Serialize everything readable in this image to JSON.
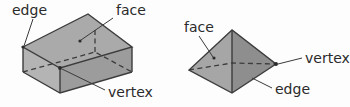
{
  "diagram": {
    "background_color": "#fdfdfd",
    "line_color": "#3c3c3c",
    "text_color": "#2b2b2b",
    "shapes": [
      {
        "id": "cuboid",
        "name": "cuboid",
        "labels": {
          "edge": "edge",
          "face": "face",
          "vertex": "vertex"
        },
        "face_colors": {
          "top": "#aaaaaa",
          "front": "#b4b4b4",
          "side": "#9c9c9c"
        }
      },
      {
        "id": "pyramid",
        "name": "square pyramid",
        "labels": {
          "face": "face",
          "vertex": "vertex",
          "edge": "edge"
        },
        "face_colors": {
          "left": "#a6a6a6",
          "right": "#8e8e8e"
        }
      }
    ]
  },
  "labels": {
    "cuboid_edge": "edge",
    "cuboid_face": "face",
    "cuboid_vertex": "vertex",
    "pyramid_face": "face",
    "pyramid_vertex": "vertex",
    "pyramid_edge": "edge"
  }
}
